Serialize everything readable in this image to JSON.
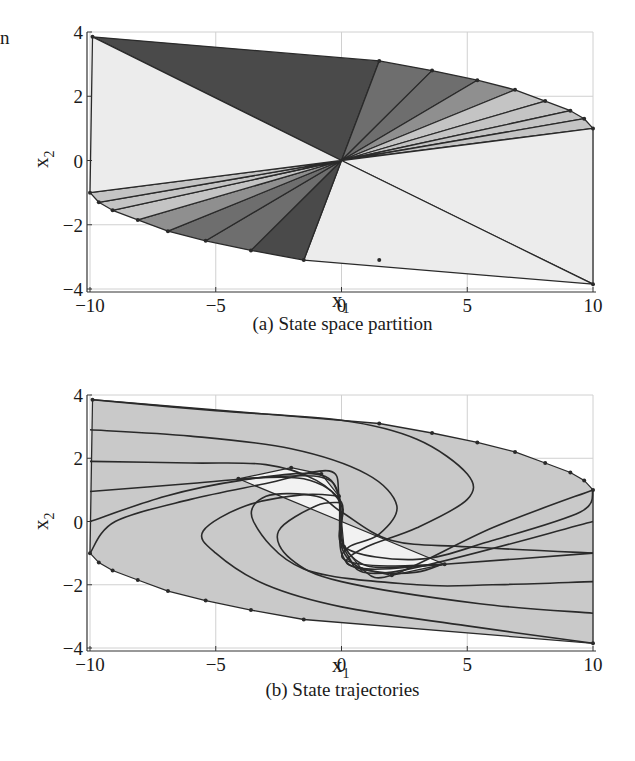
{
  "page": {
    "stray_text": "n"
  },
  "figures": [
    {
      "id": "a",
      "caption": "(a) State space partition",
      "xlabel": "x",
      "xlabel_sub": "1",
      "ylabel": "x",
      "ylabel_sub": "2",
      "xticks": [
        "−10",
        "−5",
        "0",
        "5",
        "10"
      ],
      "yticks": [
        "4",
        "2",
        "0",
        "−2",
        "−4"
      ]
    },
    {
      "id": "b",
      "caption": "(b) State trajectories",
      "xlabel": "x",
      "xlabel_sub": "1",
      "ylabel": "x",
      "ylabel_sub": "2",
      "xticks": [
        "−10",
        "−5",
        "0",
        "5",
        "10"
      ],
      "yticks": [
        "4",
        "2",
        "0",
        "−2",
        "−4"
      ]
    }
  ],
  "colors": {
    "darkest": "#4a4a4a",
    "dark": "#6e6e6e",
    "mid": "#8f8f8f",
    "light": "#c4c4c4",
    "lightest": "#ececec",
    "region_fill": "#c9c9c9",
    "inner_fill": "#f2f2f2",
    "line": "#2a2a2a",
    "grid": "#d0d0d0"
  },
  "chart_data": [
    {
      "type": "area",
      "title": "(a) State space partition",
      "xlabel": "x1",
      "ylabel": "x2",
      "xlim": [
        -10,
        10
      ],
      "ylim": [
        -4,
        4
      ],
      "xticks": [
        -10,
        -5,
        0,
        5,
        10
      ],
      "yticks": [
        -4,
        -2,
        0,
        2,
        4
      ],
      "grid": true,
      "boundary_vertices": [
        [
          -9.9,
          3.85
        ],
        [
          1.5,
          3.1
        ],
        [
          3.6,
          2.8
        ],
        [
          5.4,
          2.5
        ],
        [
          6.9,
          2.2
        ],
        [
          8.1,
          1.85
        ],
        [
          9.1,
          1.55
        ],
        [
          9.65,
          1.3
        ],
        [
          10,
          1.0
        ],
        [
          10,
          -3.85
        ],
        [
          1.5,
          -3.1
        ],
        [
          -1.5,
          -3.1
        ],
        [
          -3.6,
          -2.8
        ],
        [
          -5.4,
          -2.5
        ],
        [
          -6.9,
          -2.2
        ],
        [
          -8.1,
          -1.85
        ],
        [
          -9.1,
          -1.55
        ],
        [
          -9.65,
          -1.3
        ],
        [
          -10,
          -1.0
        ]
      ],
      "regions": [
        {
          "shade": "darkest",
          "vertices": [
            [
              0,
              0
            ],
            [
              -9.9,
              3.85
            ],
            [
              1.5,
              3.1
            ]
          ]
        },
        {
          "shade": "dark",
          "vertices": [
            [
              0,
              0
            ],
            [
              1.5,
              3.1
            ],
            [
              3.6,
              2.8
            ]
          ]
        },
        {
          "shade": "dark",
          "vertices": [
            [
              0,
              0
            ],
            [
              3.6,
              2.8
            ],
            [
              5.4,
              2.5
            ]
          ]
        },
        {
          "shade": "mid",
          "vertices": [
            [
              0,
              0
            ],
            [
              5.4,
              2.5
            ],
            [
              6.9,
              2.2
            ]
          ]
        },
        {
          "shade": "light",
          "vertices": [
            [
              0,
              0
            ],
            [
              6.9,
              2.2
            ],
            [
              8.1,
              1.85
            ]
          ]
        },
        {
          "shade": "light",
          "vertices": [
            [
              0,
              0
            ],
            [
              8.1,
              1.85
            ],
            [
              9.1,
              1.55
            ]
          ]
        },
        {
          "shade": "light",
          "vertices": [
            [
              0,
              0
            ],
            [
              9.1,
              1.55
            ],
            [
              9.65,
              1.3
            ]
          ]
        },
        {
          "shade": "light",
          "vertices": [
            [
              0,
              0
            ],
            [
              9.65,
              1.3
            ],
            [
              10,
              1.0
            ]
          ]
        },
        {
          "shade": "lightest",
          "vertices": [
            [
              0,
              0
            ],
            [
              10,
              1.0
            ],
            [
              10,
              -3.85
            ]
          ]
        },
        {
          "shade": "lightest",
          "vertices": [
            [
              0,
              0
            ],
            [
              10,
              -3.85
            ],
            [
              -1.5,
              -3.1
            ]
          ]
        },
        {
          "shade": "darkest",
          "vertices": [
            [
              0,
              0
            ],
            [
              -1.5,
              -3.1
            ],
            [
              -3.6,
              -2.8
            ]
          ]
        },
        {
          "shade": "dark",
          "vertices": [
            [
              0,
              0
            ],
            [
              -3.6,
              -2.8
            ],
            [
              -5.4,
              -2.5
            ]
          ]
        },
        {
          "shade": "dark",
          "vertices": [
            [
              0,
              0
            ],
            [
              -5.4,
              -2.5
            ],
            [
              -6.9,
              -2.2
            ]
          ]
        },
        {
          "shade": "mid",
          "vertices": [
            [
              0,
              0
            ],
            [
              -6.9,
              -2.2
            ],
            [
              -8.1,
              -1.85
            ]
          ]
        },
        {
          "shade": "light",
          "vertices": [
            [
              0,
              0
            ],
            [
              -8.1,
              -1.85
            ],
            [
              -9.1,
              -1.55
            ]
          ]
        },
        {
          "shade": "light",
          "vertices": [
            [
              0,
              0
            ],
            [
              -9.1,
              -1.55
            ],
            [
              -9.65,
              -1.3
            ]
          ]
        },
        {
          "shade": "light",
          "vertices": [
            [
              0,
              0
            ],
            [
              -9.65,
              -1.3
            ],
            [
              -10,
              -1.0
            ]
          ]
        },
        {
          "shade": "lightest",
          "vertices": [
            [
              0,
              0
            ],
            [
              -10,
              -1.0
            ],
            [
              -9.9,
              3.85
            ]
          ]
        }
      ]
    },
    {
      "type": "line",
      "title": "(b) State trajectories",
      "xlabel": "x1",
      "ylabel": "x2",
      "xlim": [
        -10,
        10
      ],
      "ylim": [
        -4,
        4
      ],
      "xticks": [
        -10,
        -5,
        0,
        5,
        10
      ],
      "yticks": [
        -4,
        -2,
        0,
        2,
        4
      ],
      "grid": true,
      "outer_region": [
        [
          -9.9,
          3.85
        ],
        [
          1.5,
          3.1
        ],
        [
          3.6,
          2.8
        ],
        [
          5.4,
          2.5
        ],
        [
          6.9,
          2.2
        ],
        [
          8.1,
          1.85
        ],
        [
          9.1,
          1.55
        ],
        [
          9.65,
          1.3
        ],
        [
          10,
          1.0
        ],
        [
          10,
          -3.85
        ],
        [
          -1.5,
          -3.1
        ],
        [
          -3.6,
          -2.8
        ],
        [
          -5.4,
          -2.5
        ],
        [
          -6.9,
          -2.2
        ],
        [
          -8.1,
          -1.85
        ],
        [
          -9.1,
          -1.55
        ],
        [
          -9.65,
          -1.3
        ],
        [
          -10,
          -1.0
        ]
      ],
      "inner_region": [
        [
          -4.1,
          1.35
        ],
        [
          -2.0,
          1.7
        ],
        [
          -0.8,
          1.5
        ],
        [
          -0.1,
          0.8
        ],
        [
          0.1,
          -0.8
        ],
        [
          0.8,
          -1.5
        ],
        [
          2.0,
          -1.7
        ],
        [
          4.1,
          -1.35
        ]
      ],
      "trajectories": [
        {
          "start": [
            -9.9,
            3.85
          ],
          "points": [
            [
              -9.9,
              3.85
            ],
            [
              -5,
              3.5
            ],
            [
              0,
              3.2
            ],
            [
              3,
              2.6
            ],
            [
              5,
              1.5
            ],
            [
              5,
              0.7
            ],
            [
              3,
              -0.2
            ],
            [
              1,
              -0.8
            ],
            [
              0.2,
              -1.3
            ],
            [
              1.5,
              -1.6
            ],
            [
              3,
              -1.6
            ],
            [
              4,
              -1.35
            ]
          ]
        },
        {
          "start": [
            -10,
            2.9
          ],
          "points": [
            [
              -10,
              2.9
            ],
            [
              -6,
              2.7
            ],
            [
              -2,
              2.3
            ],
            [
              1,
              1.5
            ],
            [
              2.2,
              0.5
            ],
            [
              1.5,
              -0.4
            ],
            [
              0.3,
              -0.8
            ],
            [
              0.1,
              -1.2
            ],
            [
              1.5,
              -1.4
            ],
            [
              4,
              -1.35
            ]
          ]
        },
        {
          "start": [
            -10,
            1.9
          ],
          "points": [
            [
              -10,
              1.9
            ],
            [
              -6,
              1.85
            ],
            [
              -3,
              1.8
            ],
            [
              -1,
              1.3
            ],
            [
              0,
              0.5
            ],
            [
              0,
              -0.6
            ],
            [
              1,
              -1.4
            ],
            [
              3,
              -1.4
            ],
            [
              4.1,
              -1.35
            ]
          ]
        },
        {
          "start": [
            -10,
            0.95
          ],
          "points": [
            [
              -10,
              0.95
            ],
            [
              -6,
              1.2
            ],
            [
              -3,
              1.4
            ],
            [
              -0.8,
              1.4
            ],
            [
              -0.1,
              0.8
            ],
            [
              0,
              -1.0
            ],
            [
              1,
              -1.5
            ],
            [
              4.1,
              -1.35
            ],
            [
              10,
              -1.0
            ]
          ]
        },
        {
          "start": [
            -10,
            0.0
          ],
          "points": [
            [
              -10,
              0.0
            ],
            [
              -7,
              0.8
            ],
            [
              -4,
              1.3
            ],
            [
              -1,
              1.5
            ],
            [
              -0.1,
              0.8
            ],
            [
              0.2,
              -1.0
            ],
            [
              2,
              -1.6
            ],
            [
              10,
              -0.0
            ]
          ]
        },
        {
          "start": [
            -10,
            -1.0
          ],
          "points": [
            [
              -10,
              -1.0
            ],
            [
              -9,
              0.0
            ],
            [
              -6,
              0.7
            ],
            [
              -3,
              1.2
            ],
            [
              -0.5,
              1.6
            ],
            [
              -0.1,
              0.8
            ],
            [
              0,
              -0.8
            ],
            [
              0.8,
              -1.5
            ],
            [
              2,
              -1.7
            ],
            [
              6,
              -0.2
            ],
            [
              10,
              1.0
            ]
          ]
        },
        {
          "start": [
            10,
            1.0
          ],
          "points": [
            [
              10,
              1.0
            ],
            [
              9.5,
              0.3
            ],
            [
              6,
              -0.6
            ],
            [
              3,
              -1.2
            ],
            [
              0.1,
              -0.8
            ],
            [
              0,
              0.6
            ],
            [
              -1.5,
              1.35
            ],
            [
              -4.1,
              1.35
            ]
          ]
        },
        {
          "start": [
            10,
            -1.0
          ],
          "points": [
            [
              10,
              -1.0
            ],
            [
              5,
              -0.8
            ],
            [
              2,
              -0.6
            ],
            [
              0,
              0.3
            ],
            [
              -1,
              0.8
            ],
            [
              -3,
              0.8
            ],
            [
              -3.5,
              0
            ],
            [
              -1.5,
              -1.5
            ],
            [
              3,
              -2.0
            ],
            [
              6,
              -2.0
            ],
            [
              10,
              -1.9
            ]
          ]
        },
        {
          "start": [
            10,
            -1.9
          ],
          "points": [
            [
              10,
              -2.9
            ],
            [
              5.5,
              -2.6
            ],
            [
              0,
              -1.9
            ],
            [
              -2,
              -1.2
            ],
            [
              -2.5,
              -0.3
            ],
            [
              -1,
              0.5
            ],
            [
              0,
              0.6
            ]
          ]
        },
        {
          "start": [
            10,
            -3.85
          ],
          "points": [
            [
              10,
              -3.85
            ],
            [
              5,
              -3.3
            ],
            [
              0,
              -2.7
            ],
            [
              -3,
              -2.0
            ],
            [
              -5,
              -1.0
            ],
            [
              -5.5,
              -0.3
            ],
            [
              -3.8,
              0.5
            ],
            [
              -1.5,
              0.85
            ],
            [
              -0.1,
              0.8
            ]
          ]
        }
      ]
    }
  ]
}
